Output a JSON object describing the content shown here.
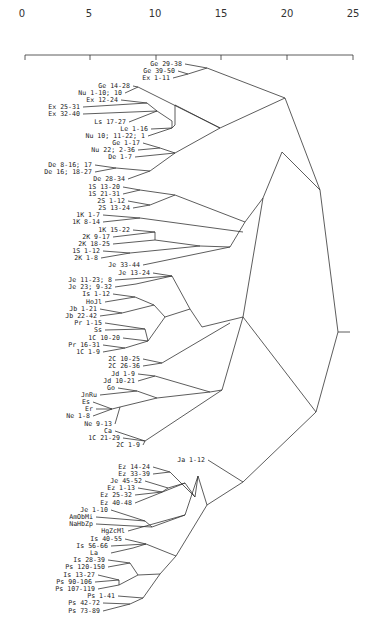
{
  "chart_data": {
    "type": "dendrogram",
    "title": "",
    "xlabel": "",
    "ylabel": "",
    "axis": {
      "ticks": [
        0,
        5,
        10,
        15,
        20,
        25
      ],
      "xlim": [
        0,
        25
      ],
      "position": "top"
    },
    "leaves": [
      "Ge 29-38",
      "Ge 39-50",
      "Ex 1-11",
      "Ge 14-28",
      "Nu 1-10; 10",
      "Ex 12-24",
      "Ex 25-31",
      "Ex 32-40",
      "Ls 17-27",
      "Le 1-16",
      "Nu 10; 11-22; 1",
      "Ge 1-17",
      "Nu 22; 2-36",
      "De 1-7",
      "De 8-16; 17",
      "De 16; 18-27",
      "De 28-34",
      "1S 13-20",
      "1S 21-31",
      "2S 1-12",
      "2S 13-24",
      "1K 1-7",
      "1K 8-14",
      "1K 15-22",
      "2K 9-17",
      "2K 18-25",
      "1S 1-12",
      "2K 1-8",
      "Je 33-44",
      "Je 13-24",
      "Je 11-23; 8",
      "Je 23; 9-32",
      "Is 1-12",
      "HoJl",
      "Jb 1-21",
      "Jb 22-42",
      "Pr 1-15",
      "Ss",
      "1C 10-20",
      "Pr 16-31",
      "1C 1-9",
      "2C 10-25",
      "2C 26-36",
      "Jd 1-9",
      "Jd 10-21",
      "Go",
      "JnRu",
      "Es",
      "Er",
      "Ne 1-8",
      "Ne 9-13",
      "Ca",
      "1C 21-29",
      "2C 1-9",
      "Ja 1-12",
      "Ez 14-24",
      "Ez 33-39",
      "Je 45-52",
      "Ez 1-13",
      "Ez 25-32",
      "Ez 40-48",
      "Je 1-10",
      "AmObMi",
      "NaHbZp",
      "HgZcMl",
      "Is 40-55",
      "Is 56-66",
      "La",
      "Is 28-39",
      "Ps 120-150",
      "Is 13-27",
      "Ps 90-106",
      "Ps 107-119",
      "Ps 1-41",
      "Ps 42-72",
      "Ps 73-89"
    ],
    "clusters": [
      {
        "members": [
          "Ge 29-38",
          "Ge 39-50",
          "Ex 1-11"
        ],
        "approx_height": 10
      },
      {
        "members": [
          "Ge 14-28",
          "Nu 1-10; 10",
          "Ex 12-24",
          "Ex 25-31",
          "Ex 32-40",
          "Ls 17-27",
          "Le 1-16",
          "Nu 10; 11-22; 1",
          "Ge 1-17",
          "Nu 22; 2-36",
          "De 1-7",
          "De 8-16; 17",
          "De 16; 18-27",
          "De 28-34"
        ],
        "approx_height": 14
      },
      {
        "members": [
          "Pentateuch group"
        ],
        "approx_height": 17
      },
      {
        "members": [
          "Samuel/Kings/Jeremiah group"
        ],
        "approx_height": 20
      },
      {
        "members": [
          "Wisdom/Chronicles/Prophets group"
        ],
        "approx_height": 18
      },
      {
        "members": [
          "Prophets/Psalms group"
        ],
        "approx_height": 18
      },
      {
        "members": [
          "all"
        ],
        "approx_height": 24
      }
    ],
    "grid": false,
    "legend": null
  },
  "labels": {
    "ticks": [
      "0",
      "5",
      "10",
      "15",
      "20",
      "25"
    ]
  }
}
